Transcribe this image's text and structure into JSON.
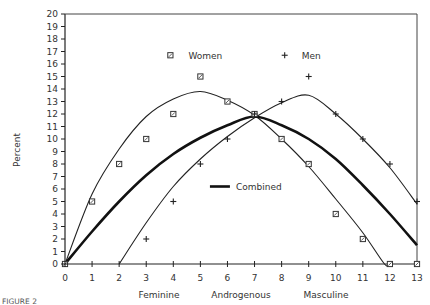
{
  "chart_data": {
    "type": "line",
    "title": "",
    "xlabel": "",
    "ylabel": "Percent",
    "xlim": [
      0,
      13
    ],
    "ylim": [
      0,
      20
    ],
    "x_ticks": [
      0,
      1,
      2,
      3,
      4,
      5,
      6,
      7,
      8,
      9,
      10,
      11,
      12,
      13
    ],
    "y_ticks": [
      0,
      1,
      2,
      3,
      4,
      5,
      6,
      7,
      8,
      9,
      10,
      11,
      12,
      13,
      14,
      15,
      16,
      17,
      18,
      19,
      20
    ],
    "x_region_labels": [
      "Feminine",
      "Androgenous",
      "Masculine"
    ],
    "grid": false,
    "caption": "FIGURE 2",
    "series": [
      {
        "name": "Women",
        "marker": "square",
        "points": [
          [
            0,
            0
          ],
          [
            1,
            5
          ],
          [
            2,
            8
          ],
          [
            3,
            10
          ],
          [
            4,
            12
          ],
          [
            5,
            15
          ],
          [
            6,
            13
          ],
          [
            7,
            12
          ],
          [
            8,
            10
          ],
          [
            9,
            8
          ],
          [
            10,
            4
          ],
          [
            11,
            2
          ],
          [
            12,
            0
          ],
          [
            13,
            0
          ]
        ],
        "fit": [
          [
            0,
            0
          ],
          [
            1,
            5.6
          ],
          [
            2,
            9.2
          ],
          [
            3,
            11.8
          ],
          [
            4,
            13.2
          ],
          [
            5,
            13.8
          ],
          [
            6,
            13.1
          ],
          [
            7,
            11.9
          ],
          [
            8,
            10.0
          ],
          [
            9,
            7.8
          ],
          [
            10,
            5.2
          ],
          [
            11,
            2.5
          ],
          [
            11.8,
            0
          ],
          [
            12,
            0
          ]
        ]
      },
      {
        "name": "Men",
        "marker": "plus",
        "points": [
          [
            0,
            0
          ],
          [
            3,
            2
          ],
          [
            4,
            5
          ],
          [
            5,
            8
          ],
          [
            6,
            10
          ],
          [
            7,
            12
          ],
          [
            8,
            13
          ],
          [
            9,
            15
          ],
          [
            10,
            12
          ],
          [
            11,
            10
          ],
          [
            12,
            8
          ],
          [
            13,
            5
          ]
        ],
        "fit": [
          [
            2,
            0
          ],
          [
            3,
            3.3
          ],
          [
            4,
            6.2
          ],
          [
            5,
            8.4
          ],
          [
            6,
            10.2
          ],
          [
            7,
            11.7
          ],
          [
            8,
            12.9
          ],
          [
            9,
            13.5
          ],
          [
            10,
            12.0
          ],
          [
            11,
            10.0
          ],
          [
            12,
            7.7
          ],
          [
            13,
            4.8
          ]
        ]
      },
      {
        "name": "Combined",
        "marker": "none",
        "line": "bold",
        "points": [
          [
            0,
            0
          ],
          [
            1,
            2.6
          ],
          [
            2,
            5.0
          ],
          [
            3,
            7.1
          ],
          [
            4,
            8.8
          ],
          [
            5,
            10.1
          ],
          [
            6,
            11.1
          ],
          [
            7,
            11.8
          ],
          [
            8,
            11.1
          ],
          [
            9,
            10.0
          ],
          [
            10,
            8.4
          ],
          [
            11,
            6.3
          ],
          [
            12,
            4.0
          ],
          [
            13,
            1.5
          ]
        ]
      }
    ],
    "legend": [
      {
        "label": "Women",
        "marker": "square",
        "x": 5,
        "y": 16.7
      },
      {
        "label": "Men",
        "marker": "plus",
        "x": 9,
        "y": 16.7
      },
      {
        "label": "Combined",
        "marker": "bold-line",
        "x": 5.5,
        "y": 6.2
      }
    ]
  },
  "labels": {
    "ylabel": "Percent",
    "feminine": "Feminine",
    "androgenous": "Androgenous",
    "masculine": "Masculine",
    "legend_women": "Women",
    "legend_men": "Men",
    "legend_combined": "Combined",
    "caption": "FIGURE 2"
  }
}
